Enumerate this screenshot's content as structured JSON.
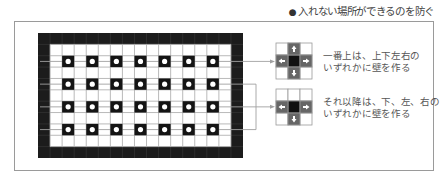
{
  "heading": {
    "bullet": "●",
    "text": "入れない場所ができるのを防ぐ"
  },
  "maze": {
    "cols": 17,
    "rows": 11,
    "pillar_rows": 4,
    "pillar_cols": 7,
    "colors": {
      "wall": "#1c1c1c",
      "wall_line": "#3a3a3a",
      "cell": "#ffffff",
      "grid_line": "#a8a8a8",
      "pillar": "#141414",
      "pillar_dot": "#ffffff",
      "connector": "#a0a0a0"
    }
  },
  "callouts": [
    {
      "rule": "first_row",
      "directions": [
        "up",
        "down",
        "left",
        "right"
      ],
      "line1": "一番上は、上下左右の",
      "line2": "いずれかに壁を作る"
    },
    {
      "rule": "other_rows",
      "directions": [
        "down",
        "left",
        "right"
      ],
      "line1": "それ以降は、下、左、右の",
      "line2": "いずれかに壁を作る"
    }
  ]
}
